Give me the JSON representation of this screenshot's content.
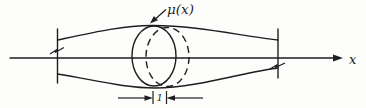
{
  "diagram": {
    "labels": {
      "mass_density": "μ(x)",
      "axis": "x",
      "slice_thickness": "1"
    },
    "colors": {
      "stroke": "#1e1e1e",
      "background": "#fdfdfc"
    }
  }
}
